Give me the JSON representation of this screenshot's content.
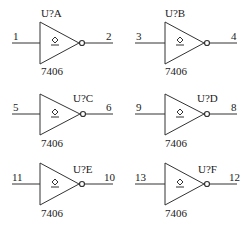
{
  "line_color": "#333333",
  "gates": [
    {
      "ref": "U?A",
      "part": "7406",
      "in_pin": "1",
      "out_pin": "2",
      "ref_pos": "top"
    },
    {
      "ref": "U?B",
      "part": "7406",
      "in_pin": "3",
      "out_pin": "4",
      "ref_pos": "top"
    },
    {
      "ref": "U?C",
      "part": "7406",
      "in_pin": "5",
      "out_pin": "6",
      "ref_pos": "right"
    },
    {
      "ref": "U?D",
      "part": "7406",
      "in_pin": "9",
      "out_pin": "8",
      "ref_pos": "right"
    },
    {
      "ref": "U?E",
      "part": "7406",
      "in_pin": "11",
      "out_pin": "10",
      "ref_pos": "right"
    },
    {
      "ref": "U?F",
      "part": "7406",
      "in_pin": "13",
      "out_pin": "12",
      "ref_pos": "right"
    }
  ]
}
